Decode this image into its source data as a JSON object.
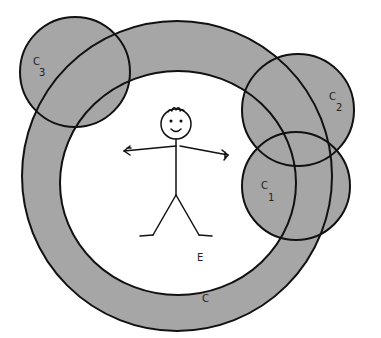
{
  "diagram": {
    "colors": {
      "fill": "#a6a6a6",
      "stroke": "#111111",
      "background": "#ffffff"
    },
    "labels": {
      "ring": "C",
      "environment": "E",
      "c1_letter": "C",
      "c1_sub": "1",
      "c2_letter": "C",
      "c2_sub": "2",
      "c3_letter": "C",
      "c3_sub": "3"
    },
    "figure": "stick-figure"
  }
}
